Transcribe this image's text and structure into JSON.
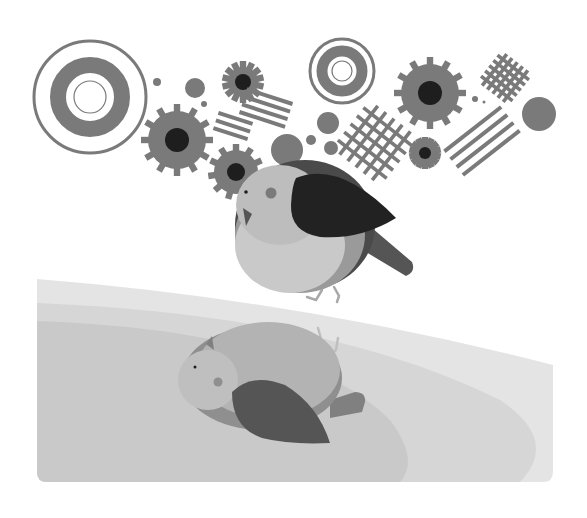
{
  "illustration": {
    "subject": "bird perched above its reflection among gears and geometric shapes",
    "width": 587,
    "height": 518,
    "background": "#ffffff"
  },
  "colors": {
    "mid": "#7a7a7a",
    "dark": "#1e1e1e",
    "wing": "#222222",
    "cap": "#4a4a4a",
    "head": "#bdbdbd",
    "belly": "#c9c9c9",
    "body_band": "#9a9a9a",
    "tail": "#555555",
    "legs": "#a8a8a8",
    "ground_top": "#e4e4e4",
    "ground_mid": "#d6d6d6",
    "ground_low": "#c9c9c9",
    "reflection_wing": "#555555",
    "reflection_head": "#bfbfbf",
    "reflection_body": "#b3b3b3",
    "reflection_band": "#8f8f8f",
    "reflection_tail": "#808080"
  },
  "decorations": {
    "targets": [
      {
        "name": "target-large",
        "cx": 90,
        "cy": 97,
        "outer_r": 56,
        "ring_r": 32,
        "ring_w": 16,
        "inner_r": 16
      },
      {
        "name": "target-small",
        "cx": 342,
        "cy": 71,
        "outer_r": 32,
        "ring_r": 20,
        "ring_w": 11,
        "inner_r": 10
      }
    ],
    "gears": [
      {
        "name": "gear-large-left",
        "cx": 177,
        "cy": 140,
        "r": 29,
        "teeth": 12,
        "tooth": 7,
        "hub": 12
      },
      {
        "name": "gear-large-right",
        "cx": 430,
        "cy": 93,
        "r": 29,
        "teeth": 12,
        "tooth": 7,
        "hub": 12
      },
      {
        "name": "gear-behind-bird",
        "cx": 236,
        "cy": 172,
        "r": 22,
        "teeth": 11,
        "tooth": 6,
        "hub": 9
      },
      {
        "name": "gear-spiky-top",
        "cx": 243,
        "cy": 82,
        "r": 15,
        "teeth": 14,
        "tooth": 6,
        "hub": 8
      },
      {
        "name": "gear-spiky-bottom",
        "cx": 425,
        "cy": 153,
        "r": 11,
        "teeth": 14,
        "tooth": 5,
        "hub": 6
      }
    ],
    "dots": [
      {
        "cx": 157,
        "cy": 82,
        "r": 4
      },
      {
        "cx": 195,
        "cy": 88,
        "r": 10
      },
      {
        "cx": 204,
        "cy": 104,
        "r": 3
      },
      {
        "cx": 328,
        "cy": 123,
        "r": 11
      },
      {
        "cx": 311,
        "cy": 140,
        "r": 5
      },
      {
        "cx": 331,
        "cy": 148,
        "r": 7
      },
      {
        "cx": 475,
        "cy": 99,
        "r": 3
      },
      {
        "cx": 484,
        "cy": 102,
        "r": 1.5
      },
      {
        "cx": 539,
        "cy": 114,
        "r": 17
      }
    ],
    "stripes": [
      {
        "name": "stripes-a",
        "cx": 266,
        "cy": 108,
        "count": 4,
        "length": 48,
        "gap": 8,
        "angle": 18
      },
      {
        "name": "stripes-b",
        "cx": 233,
        "cy": 126,
        "count": 3,
        "length": 36,
        "gap": 8,
        "angle": 18
      },
      {
        "name": "stripes-c",
        "cx": 482,
        "cy": 141,
        "count": 4,
        "length": 72,
        "gap": 10,
        "angle": -38
      }
    ],
    "grids": [
      {
        "name": "grid-large",
        "cx": 375,
        "cy": 143,
        "size": 62,
        "lines": 5,
        "angle": 38
      },
      {
        "name": "grid-small",
        "cx": 505,
        "cy": 78,
        "size": 40,
        "lines": 5,
        "angle": 38
      }
    ]
  }
}
